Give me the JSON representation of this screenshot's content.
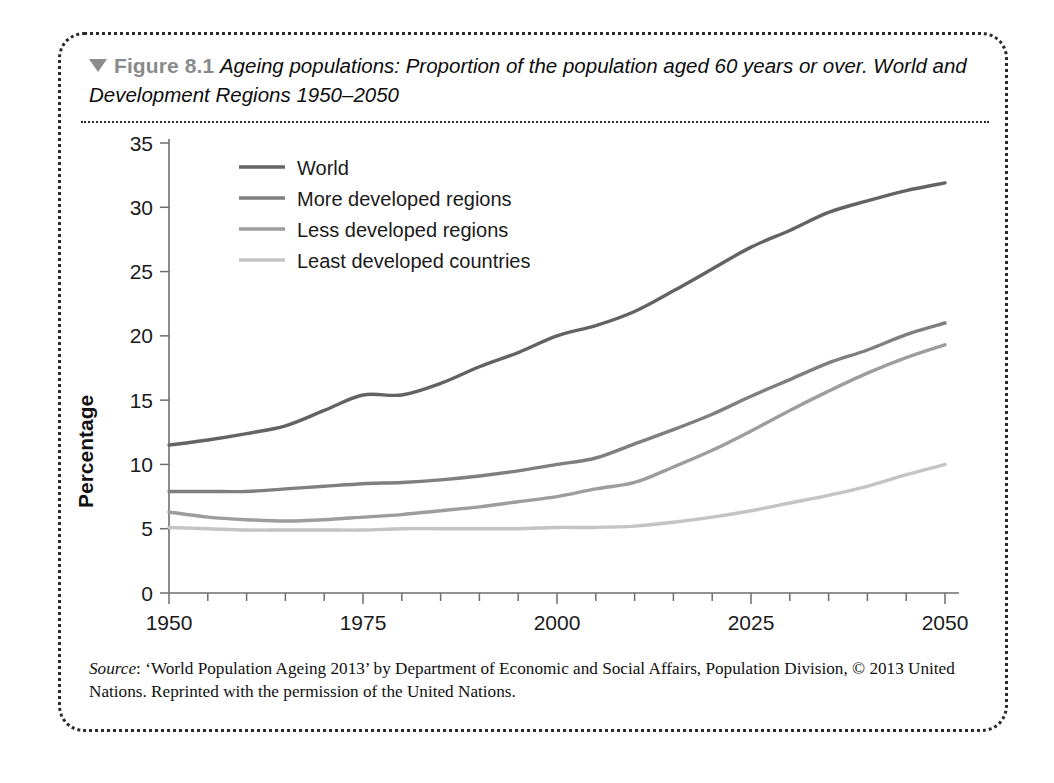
{
  "figure": {
    "marker_icon": "triangle-down-icon",
    "label": "Figure 8.1",
    "caption": "Ageing populations: Proportion of the population aged 60 years or over. World and Development Regions 1950–2050",
    "source_word": "Source",
    "source_text": ": ‘World Population Ageing 2013’ by Department of Economic and Social Affairs, Population Division, © 2013 United Nations. Reprinted with the permission of the United Nations."
  },
  "colors": {
    "world": "#636363",
    "more_developed": "#7f7f7f",
    "less_developed": "#9d9d9d",
    "least_developed": "#c4c4c4",
    "axis": "#6e6e6e",
    "figure_label": "#8a8a8a",
    "border": "#2b2b2b"
  },
  "chart_data": {
    "type": "line",
    "title": "Ageing populations: Proportion of the population aged 60 years or over. World and Development Regions 1950–2050",
    "xlabel": "",
    "ylabel": "Percentage",
    "xlim": [
      1950,
      2050
    ],
    "ylim": [
      0,
      35
    ],
    "ytick_labels": [
      "0",
      "5",
      "10",
      "15",
      "20",
      "25",
      "30",
      "35"
    ],
    "yticks": [
      0,
      5,
      10,
      15,
      20,
      25,
      30,
      35
    ],
    "xtick_labels": [
      "1950",
      "1975",
      "2000",
      "2025",
      "2050"
    ],
    "xticks": [
      1950,
      1975,
      2000,
      2025,
      2050
    ],
    "xminor_step": 5,
    "grid": false,
    "legend_position": "upper-left",
    "x": [
      1950,
      1955,
      1960,
      1965,
      1970,
      1975,
      1980,
      1985,
      1990,
      1995,
      2000,
      2005,
      2010,
      2015,
      2020,
      2025,
      2030,
      2035,
      2040,
      2045,
      2050
    ],
    "series": [
      {
        "name": "World",
        "color": "#636363",
        "values": [
          11.5,
          11.9,
          12.4,
          13.0,
          14.2,
          15.4,
          15.4,
          16.3,
          17.6,
          18.7,
          20.0,
          20.8,
          21.9,
          23.5,
          25.2,
          26.9,
          28.2,
          29.6,
          30.5,
          31.3,
          31.9
        ]
      },
      {
        "name": "More developed regions",
        "color": "#7f7f7f",
        "values": [
          7.9,
          7.9,
          7.9,
          8.1,
          8.3,
          8.5,
          8.6,
          8.8,
          9.1,
          9.5,
          10.0,
          10.5,
          11.6,
          12.7,
          13.9,
          15.3,
          16.6,
          17.9,
          18.9,
          20.1,
          21.0
        ]
      },
      {
        "name": "Less developed regions",
        "color": "#9d9d9d",
        "values": [
          6.3,
          5.9,
          5.7,
          5.6,
          5.7,
          5.9,
          6.1,
          6.4,
          6.7,
          7.1,
          7.5,
          8.1,
          8.6,
          9.8,
          11.1,
          12.6,
          14.2,
          15.7,
          17.1,
          18.3,
          19.3
        ]
      },
      {
        "name": "Least developed countries",
        "color": "#c4c4c4",
        "values": [
          5.1,
          5.0,
          4.9,
          4.9,
          4.9,
          4.9,
          5.0,
          5.0,
          5.0,
          5.0,
          5.1,
          5.1,
          5.2,
          5.5,
          5.9,
          6.4,
          7.0,
          7.6,
          8.3,
          9.2,
          10.0
        ]
      }
    ]
  }
}
